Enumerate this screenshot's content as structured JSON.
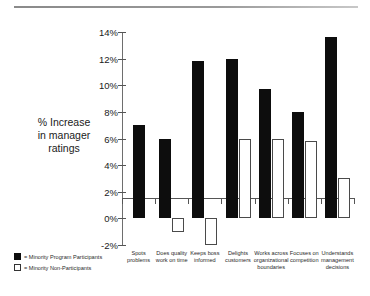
{
  "chart_data": {
    "type": "bar",
    "title": "",
    "xlabel": "",
    "ylabel": "% Increase in manager ratings",
    "ylim": [
      -2,
      14
    ],
    "ytick_labels": [
      "14%",
      "12%",
      "10%",
      "8%",
      "6%",
      "4%",
      "2%",
      "0%",
      "-2%"
    ],
    "ytick_values": [
      14,
      12,
      10,
      8,
      6,
      4,
      2,
      0,
      -2
    ],
    "grid": false,
    "legend_position": "bottom-left",
    "categories": [
      "Spots problems",
      "Does quality work on time",
      "Keeps boss informed",
      "Delights customers",
      "Works across organizational boundaries",
      "Focuses on competition",
      "Understands management decisions"
    ],
    "category_lines": [
      [
        "Spots",
        "problems"
      ],
      [
        "Does quality",
        "work on time"
      ],
      [
        "Keeps boss",
        "informed"
      ],
      [
        "Delights",
        "customers"
      ],
      [
        "Works across",
        "organizational",
        "boundaries"
      ],
      [
        "Focuses on",
        "competition"
      ],
      [
        "Understands",
        "management",
        "decisions"
      ]
    ],
    "series": [
      {
        "name": "Minority Program Participants",
        "color": "#0d0d0d",
        "values": [
          7.0,
          6.0,
          11.8,
          12.0,
          9.7,
          8.0,
          13.6
        ]
      },
      {
        "name": "Minority Non-Participants",
        "color": "#ffffff",
        "values": [
          null,
          -1.0,
          -2.0,
          6.0,
          6.0,
          5.8,
          3.0
        ]
      }
    ]
  },
  "axis_caption": {
    "line1": "% Increase",
    "line2": "in manager",
    "line3": "ratings"
  },
  "legend": {
    "items": [
      {
        "marker": "filled-square",
        "text": "= Minority Program Participants"
      },
      {
        "marker": "open-square",
        "text": "= Minority Non-Participants"
      }
    ]
  }
}
